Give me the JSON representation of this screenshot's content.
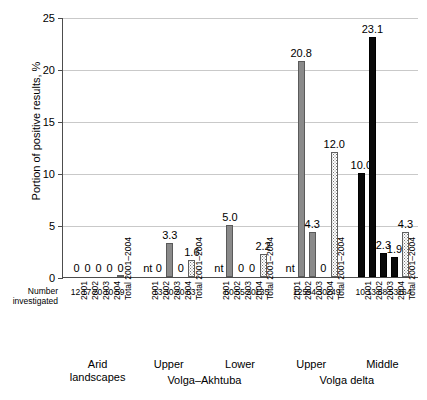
{
  "chart_data": {
    "type": "bar",
    "title": "",
    "xlabel": "",
    "ylabel": "Portion of positive results, %",
    "ylim": [
      0,
      25
    ],
    "yticks": [
      0,
      5,
      10,
      15,
      20,
      25
    ],
    "grid": true,
    "legend": "none",
    "row_header": "Number investigated",
    "year_categories": [
      "2001",
      "2002",
      "2003",
      "2004",
      "Total 2001–2004"
    ],
    "groups": [
      {
        "label": "Arid landscapes",
        "supergroup": "",
        "bars": [
          {
            "year": "2001",
            "value": 0,
            "label": "0",
            "style": "gray",
            "investigated": "12"
          },
          {
            "year": "2002",
            "value": 0,
            "label": "0",
            "style": "gray",
            "investigated": "17"
          },
          {
            "year": "2003",
            "value": 0,
            "label": "0",
            "style": "gray",
            "investigated": "20"
          },
          {
            "year": "2004",
            "value": 0,
            "label": "0",
            "style": "gray",
            "investigated": "10"
          },
          {
            "year": "Total 2001–2004",
            "value": 0,
            "label": "0",
            "style": "total",
            "investigated": "59"
          }
        ]
      },
      {
        "label": "Upper",
        "supergroup": "Volga–Akhtuba",
        "bars": [
          {
            "year": "2001",
            "value": null,
            "label": "nt",
            "style": "none",
            "investigated": ""
          },
          {
            "year": "2002",
            "value": 0,
            "label": "0",
            "style": "gray",
            "investigated": "13"
          },
          {
            "year": "2003",
            "value": 3.3,
            "label": "3.3",
            "style": "gray",
            "investigated": "30"
          },
          {
            "year": "2004",
            "value": 0,
            "label": "0",
            "style": "gray",
            "investigated": "20"
          },
          {
            "year": "Total 2001–2004",
            "value": 1.6,
            "label": "1.6",
            "style": "total",
            "investigated": "63"
          }
        ]
      },
      {
        "label": "Lower",
        "supergroup": "Volga–Akhtuba",
        "bars": [
          {
            "year": "2001",
            "value": null,
            "label": "nt",
            "style": "none",
            "investigated": ""
          },
          {
            "year": "2002",
            "value": 5.0,
            "label": "5.0",
            "style": "gray",
            "investigated": "60"
          },
          {
            "year": "2003",
            "value": 0,
            "label": "0",
            "style": "gray",
            "investigated": "55"
          },
          {
            "year": "2004",
            "value": 0,
            "label": "0",
            "style": "gray",
            "investigated": "20"
          },
          {
            "year": "Total 2001–2004",
            "value": 2.2,
            "label": "2.2",
            "style": "total",
            "investigated": "135"
          }
        ]
      },
      {
        "label": "Upper",
        "supergroup": "Volga delta",
        "bars": [
          {
            "year": "2001",
            "value": null,
            "label": "nt",
            "style": "none",
            "investigated": ""
          },
          {
            "year": "2002",
            "value": 20.8,
            "label": "20.8",
            "style": "gray",
            "investigated": "125"
          },
          {
            "year": "2003",
            "value": 4.3,
            "label": "4.3",
            "style": "gray",
            "investigated": "94"
          },
          {
            "year": "2004",
            "value": 0,
            "label": "0",
            "style": "gray",
            "investigated": "30"
          },
          {
            "year": "Total 2001–2004",
            "value": 12.0,
            "label": "12.0",
            "style": "total",
            "investigated": "249"
          }
        ]
      },
      {
        "label": "Middle",
        "supergroup": "Volga delta",
        "bars": [
          {
            "year": "2001",
            "value": 10.0,
            "label": "10.0",
            "style": "black",
            "investigated": "10"
          },
          {
            "year": "2002",
            "value": 23.1,
            "label": "23.1",
            "style": "black",
            "investigated": "13"
          },
          {
            "year": "2003",
            "value": 2.3,
            "label": "2.3",
            "style": "black",
            "investigated": "88"
          },
          {
            "year": "2004",
            "value": 1.9,
            "label": "1.9",
            "style": "black",
            "investigated": "53"
          },
          {
            "year": "Total 2001–2004",
            "value": 4.3,
            "label": "4.3",
            "style": "total",
            "investigated": "164"
          }
        ]
      }
    ]
  }
}
